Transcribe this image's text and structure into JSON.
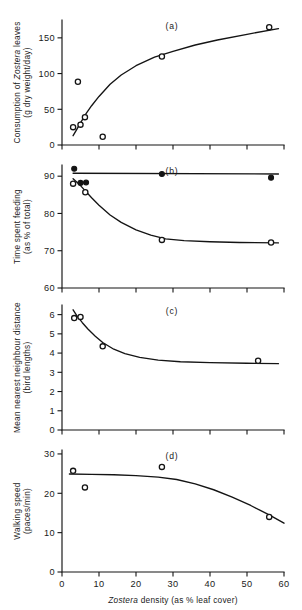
{
  "figure": {
    "xlabel_parts": {
      "italic": "Zostera",
      "rest": " density (as % leaf cover)"
    },
    "x_ticks": [
      "0",
      "10",
      "20",
      "30",
      "40",
      "50",
      "60"
    ],
    "xlim": [
      0,
      60
    ]
  },
  "chart_data": [
    {
      "type": "scatter",
      "panel": "(a)",
      "title": "",
      "xlabel": "Zostera density (as % leaf cover)",
      "ylabel_line1_italic": "Zostera",
      "ylabel_line1_pre": "Consumption of ",
      "ylabel_line1_post": " leaves",
      "ylabel_line2": "(g dry weight/day)",
      "ylabel": "Consumption of Zostera leaves (g dry weight/day)",
      "xlim": [
        0,
        60
      ],
      "ylim": [
        0,
        175
      ],
      "y_ticks": [
        "0",
        "50",
        "100",
        "150"
      ],
      "y_tick_values": [
        0,
        50,
        100,
        150
      ],
      "grid": false,
      "legend": "none",
      "series": [
        {
          "name": "Consumption",
          "marker": "open-circle",
          "x": [
            3.0,
            4.3,
            5.0,
            6.2,
            11.0,
            27.0,
            56.0
          ],
          "y": [
            25.0,
            88.5,
            28.5,
            39.0,
            11.5,
            124.0,
            165.0
          ]
        }
      ],
      "fit_curve": {
        "x": [
          3.0,
          4.0,
          5.0,
          6.5,
          8.0,
          10.0,
          13.0,
          16.0,
          20.0,
          25.0,
          30.0,
          36.0,
          42.0,
          50.0,
          58.5
        ],
        "y": [
          13.0,
          22.0,
          31.0,
          44.0,
          55.0,
          68.0,
          85.0,
          98.0,
          111.0,
          123.0,
          131.0,
          140.0,
          147.0,
          155.0,
          163.0
        ]
      }
    },
    {
      "type": "scatter",
      "panel": "(b)",
      "title": "",
      "xlabel": "Zostera density (as % leaf cover)",
      "ylabel_line1": "Time spent feeding",
      "ylabel_line2": "(as % of total)",
      "ylabel": "Time spent feeding (as % of total)",
      "xlim": [
        0,
        60
      ],
      "ylim": [
        60,
        93
      ],
      "y_ticks": [
        "60",
        "70",
        "80",
        "90"
      ],
      "y_tick_values": [
        60,
        70,
        80,
        90
      ],
      "grid": false,
      "legend": "none",
      "series": [
        {
          "name": "Filled series",
          "marker": "filled-circle",
          "x": [
            3.3,
            5.0,
            6.5,
            27.0,
            56.5
          ],
          "y": [
            92.0,
            88.2,
            88.3,
            90.6,
            89.6
          ]
        },
        {
          "name": "Open series",
          "marker": "open-circle",
          "x": [
            3.0,
            6.3,
            27.0,
            56.5
          ],
          "y": [
            88.0,
            85.7,
            72.9,
            72.2
          ]
        }
      ],
      "fit_curve_flat": {
        "x": [
          3.0,
          58.5
        ],
        "y": [
          90.8,
          90.6
        ]
      },
      "fit_curve_decline": {
        "x": [
          3.0,
          4.5,
          6.0,
          8.0,
          10.0,
          13.0,
          16.0,
          20.0,
          24.0,
          28.0,
          33.0,
          40.0,
          48.0,
          58.5
        ],
        "y": [
          89.3,
          88.0,
          86.4,
          84.2,
          82.2,
          79.6,
          77.6,
          75.6,
          74.2,
          73.2,
          72.7,
          72.4,
          72.2,
          72.1
        ]
      }
    },
    {
      "type": "scatter",
      "panel": "(c)",
      "title": "",
      "xlabel": "Zostera density (as % leaf cover)",
      "ylabel_line1": "Mean nearest neighbour distance",
      "ylabel_line2": "(bird lengths)",
      "ylabel": "Mean nearest neighbour distance (bird lengths)",
      "xlim": [
        0,
        60
      ],
      "ylim": [
        0,
        6.5
      ],
      "y_ticks": [
        "0",
        "1",
        "2",
        "3",
        "4",
        "5",
        "6"
      ],
      "y_tick_values": [
        0,
        1,
        2,
        3,
        4,
        5,
        6
      ],
      "grid": false,
      "legend": "none",
      "series": [
        {
          "name": "Nearest neighbour distance",
          "marker": "open-circle",
          "x": [
            3.3,
            5.0,
            11.0,
            53.0
          ],
          "y": [
            5.82,
            5.88,
            4.35,
            3.6
          ]
        }
      ],
      "fit_curve": {
        "x": [
          3.0,
          4.0,
          5.5,
          7.0,
          9.0,
          11.0,
          14.0,
          17.0,
          21.0,
          26.0,
          32.0,
          40.0,
          50.0,
          58.5
        ],
        "y": [
          6.25,
          5.95,
          5.58,
          5.25,
          4.88,
          4.55,
          4.2,
          3.97,
          3.78,
          3.63,
          3.55,
          3.5,
          3.47,
          3.45
        ]
      }
    },
    {
      "type": "scatter",
      "panel": "(d)",
      "title": "",
      "xlabel": "Zostera density (as % leaf cover)",
      "ylabel_line1": "Walking speed",
      "ylabel_line2": "(paces/min)",
      "ylabel": "Walking speed (paces/min)",
      "xlim": [
        0,
        60
      ],
      "ylim": [
        0,
        31
      ],
      "y_ticks": [
        "0",
        "10",
        "20",
        "30"
      ],
      "y_tick_values": [
        0,
        10,
        20,
        30
      ],
      "grid": false,
      "legend": "none",
      "series": [
        {
          "name": "Walking speed",
          "marker": "open-circle",
          "x": [
            3.0,
            6.2,
            27.0,
            56.0
          ],
          "y": [
            25.7,
            21.5,
            26.7,
            14.0
          ]
        }
      ],
      "fit_curve": {
        "x": [
          2.0,
          8.0,
          14.0,
          20.0,
          26.0,
          31.0,
          36.0,
          41.0,
          46.0,
          51.0,
          56.0,
          60.0
        ],
        "y": [
          24.9,
          24.8,
          24.7,
          24.5,
          24.1,
          23.5,
          22.4,
          20.9,
          19.0,
          16.9,
          14.5,
          12.4
        ]
      }
    }
  ]
}
